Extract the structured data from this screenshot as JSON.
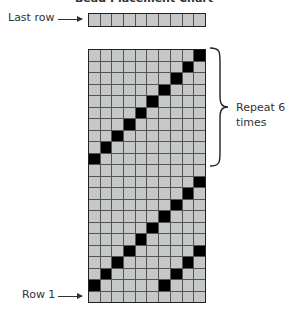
{
  "title": "Bead Placement Chart",
  "labels": {
    "last_row": "Last row",
    "row_1": "Row 1",
    "repeat_line1": "Repeat 6",
    "repeat_line2": "times"
  },
  "colors": {
    "bead_off": "#c6c8c8",
    "bead_on": "#000000",
    "grid_line": "#555555"
  },
  "last_row_strip": {
    "columns": 10,
    "filled": []
  },
  "chart_data": {
    "type": "heatmap",
    "title": "Bead Placement Chart",
    "columns": 10,
    "rows": 22,
    "row_order": "top-to-bottom",
    "filled_columns_per_row": [
      [
        10
      ],
      [
        9
      ],
      [
        8
      ],
      [
        7
      ],
      [
        6
      ],
      [
        5
      ],
      [
        4
      ],
      [
        3
      ],
      [
        2
      ],
      [
        1
      ],
      [],
      [
        10
      ],
      [
        9
      ],
      [
        8
      ],
      [
        7
      ],
      [
        6
      ],
      [
        5
      ],
      [
        4,
        10
      ],
      [
        3,
        9
      ],
      [
        2,
        8
      ],
      [
        1,
        7
      ],
      []
    ],
    "repeat_block": {
      "rows_from_top": [
        1,
        10
      ],
      "times": 6,
      "annotation": "Repeat 6 times"
    },
    "annotations": [
      "Last row",
      "Row 1",
      "Repeat 6 times"
    ]
  }
}
